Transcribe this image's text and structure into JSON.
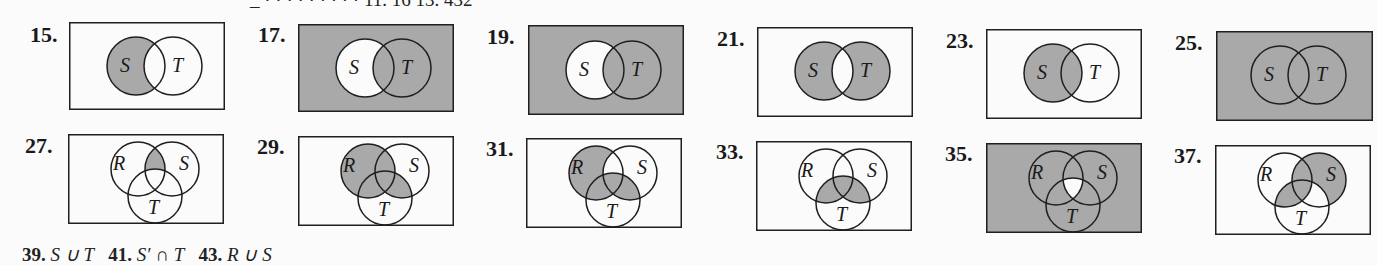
{
  "page": {
    "top_partial_line": "_ · · · · · · · · ·   11. 16   13. 432",
    "bottom_partial_line": {
      "n39": "39.",
      "t39": "S ∪ T",
      "n41": "41.",
      "t41": "S′ ∩ T",
      "n43": "43.",
      "t43": "R ∪ S"
    }
  },
  "colors": {
    "shade": "#a9a9a9",
    "paper": "#fbfbfb",
    "ink": "#1f1f1f"
  },
  "figures": [
    {
      "number": "15.",
      "sets": [
        "S",
        "T"
      ],
      "shaded": "S only (S minus T)",
      "labels": {
        "S": "S",
        "T": "T"
      }
    },
    {
      "number": "17.",
      "sets": [
        "S",
        "T"
      ],
      "shaded": "complement of (S minus T)",
      "labels": {
        "S": "S",
        "T": "T"
      }
    },
    {
      "number": "19.",
      "sets": [
        "S",
        "T"
      ],
      "shaded": "complement of (S minus T)",
      "labels": {
        "S": "S",
        "T": "T"
      }
    },
    {
      "number": "21.",
      "sets": [
        "S",
        "T"
      ],
      "shaded": "symmetric difference (S ∪ T minus S ∩ T)",
      "labels": {
        "S": "S",
        "T": "T"
      }
    },
    {
      "number": "23.",
      "sets": [
        "S",
        "T"
      ],
      "shaded": "S",
      "labels": {
        "S": "S",
        "T": "T"
      }
    },
    {
      "number": "25.",
      "sets": [
        "S",
        "T"
      ],
      "shaded": "universe (all)",
      "labels": {
        "S": "S",
        "T": "T"
      }
    },
    {
      "number": "27.",
      "sets": [
        "R",
        "S",
        "T"
      ],
      "shaded": "R ∩ S minus T",
      "labels": {
        "R": "R",
        "S": "S",
        "T": "T"
      }
    },
    {
      "number": "29.",
      "sets": [
        "R",
        "S",
        "T"
      ],
      "shaded": "R ∪ (S ∩ T)",
      "labels": {
        "R": "R",
        "S": "S",
        "T": "T"
      }
    },
    {
      "number": "31.",
      "sets": [
        "R",
        "S",
        "T"
      ],
      "shaded": "(R minus S) ∪ (S ∩ T)",
      "labels": {
        "R": "R",
        "S": "S",
        "T": "T"
      }
    },
    {
      "number": "33.",
      "sets": [
        "R",
        "S",
        "T"
      ],
      "shaded": "T ∩ (R ∪ S)",
      "labels": {
        "R": "R",
        "S": "S",
        "T": "T"
      }
    },
    {
      "number": "35.",
      "sets": [
        "R",
        "S",
        "T"
      ],
      "shaded": "complement of (R ∩ S ∩ T)",
      "labels": {
        "R": "R",
        "S": "S",
        "T": "T"
      }
    },
    {
      "number": "37.",
      "sets": [
        "R",
        "S",
        "T"
      ],
      "shaded": "(S minus T) ∪ (T ∩ (R ∪ S))",
      "labels": {
        "R": "R",
        "S": "S",
        "T": "T"
      }
    }
  ]
}
